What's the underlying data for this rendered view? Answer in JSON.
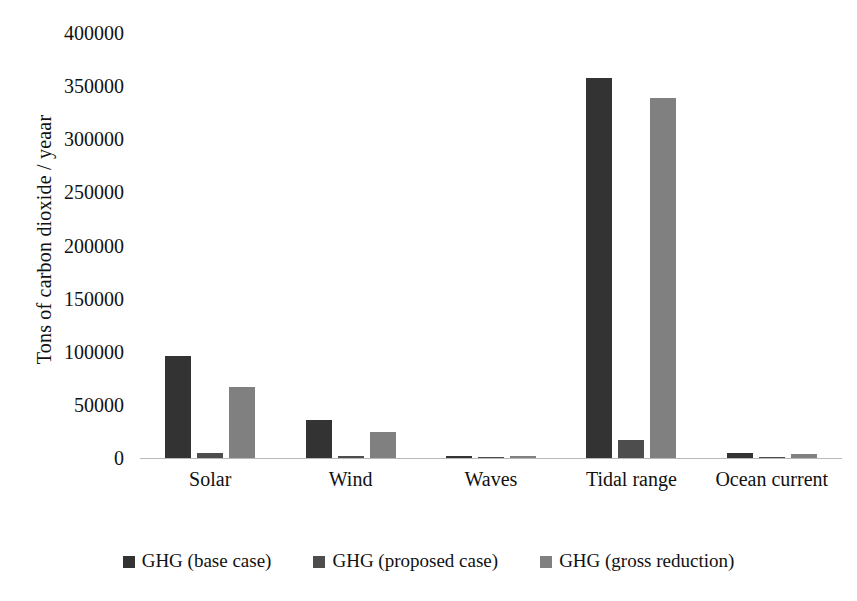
{
  "chart_data": {
    "type": "bar",
    "title": "",
    "xlabel": "",
    "ylabel": "Tons of carbon dioxide / yeaar",
    "categories": [
      "Solar",
      "Wind",
      "Waves",
      "Tidal range",
      "Ocean current"
    ],
    "series": [
      {
        "name": "GHG (base case)",
        "color": "#333333",
        "values": [
          96000,
          35500,
          2300,
          357500,
          4700
        ]
      },
      {
        "name": "GHG (proposed case)",
        "color": "#4d4d4d",
        "values": [
          4500,
          1500,
          400,
          16500,
          300
        ]
      },
      {
        "name": "GHG (gross reduction)",
        "color": "#808080",
        "values": [
          66500,
          24500,
          2000,
          339000,
          4200
        ]
      }
    ],
    "ylim": [
      0,
      400000
    ],
    "y_ticks": [
      0,
      50000,
      100000,
      150000,
      200000,
      250000,
      300000,
      350000,
      400000
    ],
    "y_tick_labels": [
      "0",
      "50000",
      "100000",
      "150000",
      "200000",
      "250000",
      "300000",
      "350000",
      "400000"
    ],
    "grid": false,
    "legend_position": "bottom"
  },
  "axis": {
    "y_title": "Tons of carbon dioxide / yeaar"
  },
  "legend": {
    "items": [
      {
        "label": "GHG (base case)",
        "color": "#333333"
      },
      {
        "label": "GHG (proposed case)",
        "color": "#4d4d4d"
      },
      {
        "label": "GHG (gross reduction)",
        "color": "#808080"
      }
    ]
  }
}
